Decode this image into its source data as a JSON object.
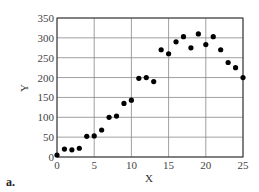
{
  "panel_label": "a.",
  "chart_data": {
    "type": "scatter",
    "title": "",
    "xlabel": "X",
    "ylabel": "Y",
    "xlim": [
      0,
      25
    ],
    "ylim": [
      0,
      350
    ],
    "xticks": [
      0,
      5,
      10,
      15,
      20,
      25
    ],
    "yticks": [
      0,
      50,
      100,
      150,
      200,
      250,
      300,
      350
    ],
    "grid": true,
    "legend": null,
    "series": [
      {
        "name": "data",
        "x": [
          0,
          1,
          2,
          3,
          4,
          5,
          6,
          7,
          8,
          9,
          10,
          11,
          12,
          13,
          14,
          15,
          16,
          17,
          18,
          19,
          20,
          21,
          22,
          23,
          24,
          25
        ],
        "y": [
          5,
          20,
          18,
          22,
          52,
          53,
          68,
          100,
          103,
          135,
          143,
          198,
          200,
          190,
          270,
          260,
          290,
          303,
          275,
          310,
          283,
          303,
          270,
          238,
          225,
          200
        ]
      }
    ],
    "colors": {
      "points": "#000000",
      "grid": "#888888",
      "frame": "#333333"
    }
  }
}
